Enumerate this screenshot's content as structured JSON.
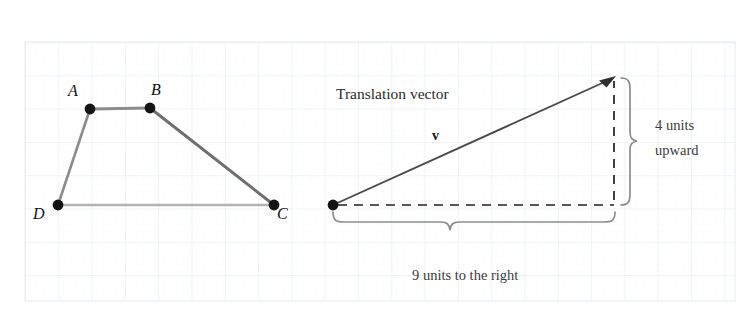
{
  "figure": {
    "type": "geometry-translation-diagram",
    "background_color": "#ffffff",
    "grid": {
      "visible": true,
      "major_line_color": "#e3e8f0",
      "minor_line_color": "#eef1f6",
      "left": 25,
      "top": 42,
      "right": 735,
      "bottom": 301,
      "major_spacing": 33.3,
      "minor_divisions": 5
    },
    "shape": {
      "name": "quadrilateral-ABCD",
      "stroke_color": "#7a7a7a",
      "vertex_color": "#111111",
      "vertices": [
        {
          "label": "A",
          "x": 90,
          "y": 109,
          "label_x": 68,
          "label_y": 83
        },
        {
          "label": "B",
          "x": 150,
          "y": 108,
          "label_x": 151,
          "label_y": 82
        },
        {
          "label": "C",
          "x": 274,
          "y": 205,
          "label_x": 277,
          "label_y": 206
        },
        {
          "label": "D",
          "x": 58,
          "y": 205,
          "label_x": 33,
          "label_y": 206
        }
      ]
    },
    "vector": {
      "label": "v",
      "title": "Translation vector",
      "title_x": 336,
      "title_y": 86,
      "label_x": 432,
      "label_y": 129,
      "origin_x": 333,
      "origin_y": 205,
      "tip_x": 615,
      "tip_y": 77,
      "stroke_color": "#4a4a4a",
      "dash_color": "#1f1f1f"
    },
    "annotations": {
      "vertical": {
        "line1": "4 units",
        "line2": "upward",
        "text_x": 655,
        "text_y": 118,
        "brace_color": "#8a8a8a"
      },
      "horizontal": {
        "text": "9 units to the right",
        "text_x": 412,
        "text_y": 268,
        "brace_color": "#8a8a8a"
      }
    }
  }
}
